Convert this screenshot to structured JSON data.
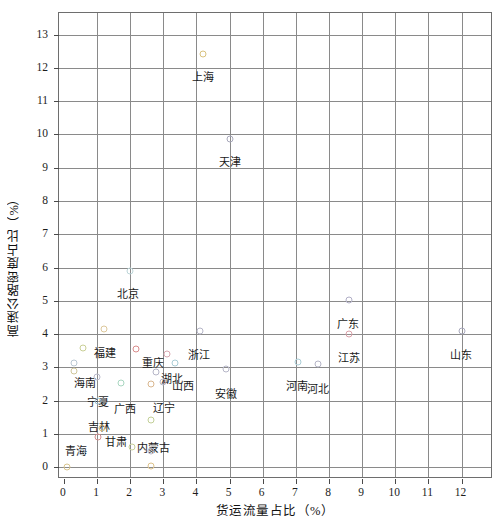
{
  "chart_data": {
    "type": "scatter",
    "title": "",
    "xlabel": "货运流量占比（%）",
    "ylabel": "高速公路密度占比（%）",
    "xlim": [
      -0.15,
      12.95
    ],
    "ylim": [
      -0.35,
      13.65
    ],
    "xticks": [
      0,
      1,
      2,
      3,
      4,
      5,
      6,
      7,
      8,
      9,
      10,
      11,
      12
    ],
    "yticks": [
      0,
      1,
      2,
      3,
      4,
      5,
      6,
      7,
      8,
      9,
      10,
      11,
      12,
      13
    ],
    "grid": true,
    "legend": "none",
    "points": [
      {
        "label": "上海",
        "x": 4.2,
        "y": 12.42,
        "color": "#d9c27e",
        "lx": 0,
        "ly": 14
      },
      {
        "label": "天津",
        "x": 5.0,
        "y": 9.85,
        "color": "#a8a8bb",
        "lx": 0,
        "ly": 14
      },
      {
        "label": "北京",
        "x": 2.0,
        "y": 5.9,
        "color": "#bcd5d8",
        "lx": -2,
        "ly": 14
      },
      {
        "label": "广东",
        "x": 8.6,
        "y": 5.02,
        "color": "#b0aec6",
        "lx": -1,
        "ly": 15
      },
      {
        "label": "江苏",
        "x": 8.6,
        "y": 4.0,
        "color": "#d9a0a8",
        "lx": 0,
        "ly": 15
      },
      {
        "label": "山东",
        "x": 12.0,
        "y": 4.1,
        "color": "#a9a9bd",
        "lx": -1,
        "ly": 15
      },
      {
        "label": "浙江",
        "x": 4.1,
        "y": 4.1,
        "color": "#b6b6c8",
        "lx": -1,
        "ly": 15
      },
      {
        "label": "福建",
        "x": 1.22,
        "y": 4.15,
        "color": "#dcc79a",
        "lx": 1,
        "ly": 15
      },
      {
        "label": "重庆",
        "x": 2.18,
        "y": 3.55,
        "color": "#d98b8b",
        "lx": 17,
        "ly": 5
      },
      {
        "label": "湖北",
        "x": 3.1,
        "y": 3.4,
        "color": "#d9a7b0",
        "lx": 5,
        "ly": 16
      },
      {
        "label": "山西",
        "x": 3.35,
        "y": 3.12,
        "color": "#a9cdd6",
        "lx": 8,
        "ly": 14
      },
      {
        "label": "海南",
        "x": 0.58,
        "y": 3.6,
        "color": "#c9cf95",
        "lx": 2,
        "ly": 26
      },
      {
        "label": "安徽",
        "x": 4.9,
        "y": 2.95,
        "color": "#b6b6c8",
        "lx": 0,
        "ly": 16
      },
      {
        "label": "河南",
        "x": 7.05,
        "y": 3.18,
        "color": "#aacdd6",
        "lx": -1,
        "ly": 15
      },
      {
        "label": "河北",
        "x": 7.68,
        "y": 3.1,
        "color": "#b5b5c7",
        "lx": 0,
        "ly": 16
      },
      {
        "label": "宁夏",
        "x": 1.0,
        "y": 2.7,
        "color": "#b9b9cb",
        "lx": 1,
        "ly": 16
      },
      {
        "label": "广西",
        "x": 1.72,
        "y": 2.52,
        "color": "#a8d6c0",
        "lx": 4,
        "ly": 17
      },
      {
        "label": "辽宁",
        "x": 2.98,
        "y": 2.55,
        "color": "#b8b8ca",
        "lx": 1,
        "ly": 17
      },
      {
        "label": "吉林",
        "x": 1.02,
        "y": 2.0,
        "color": "#9fc4d4",
        "lx": 1,
        "ly": 17
      },
      {
        "label": "甘肃",
        "x": 1.15,
        "y": 1.18,
        "color": "#d8c48c",
        "lx": 14,
        "ly": 5
      },
      {
        "label": "内蒙古",
        "x": 2.62,
        "y": 1.42,
        "color": "#c2cf97",
        "lx": 3,
        "ly": 19
      },
      {
        "label": "青海",
        "x": 1.02,
        "y": 0.9,
        "color": "#d58f8f",
        "lx": -22,
        "ly": 5
      },
      {
        "label": "",
        "x": 0.3,
        "y": 3.12,
        "color": "#b9c7d2",
        "lx": 0,
        "ly": 0
      },
      {
        "label": "",
        "x": 0.3,
        "y": 2.88,
        "color": "#cfc69a",
        "lx": 0,
        "ly": 0
      },
      {
        "label": "",
        "x": 2.62,
        "y": 2.5,
        "color": "#d9b68e",
        "lx": 0,
        "ly": 0
      },
      {
        "label": "",
        "x": 2.78,
        "y": 2.85,
        "color": "#b5b5c7",
        "lx": 0,
        "ly": 0
      },
      {
        "label": "",
        "x": 0.55,
        "y": 0.45,
        "color": "#b8c9cf",
        "lx": 0,
        "ly": 0
      },
      {
        "label": "",
        "x": 0.1,
        "y": 0.02,
        "color": "#d8c48c",
        "lx": 0,
        "ly": 0
      },
      {
        "label": "",
        "x": 2.62,
        "y": 0.5,
        "color": "#b8b8ca",
        "lx": 0,
        "ly": 0
      },
      {
        "label": "",
        "x": 2.62,
        "y": 0.05,
        "color": "#dcc189",
        "lx": 0,
        "ly": 0
      },
      {
        "label": "",
        "x": 2.05,
        "y": 0.62,
        "color": "#c7cf98",
        "lx": 0,
        "ly": 0
      }
    ]
  }
}
